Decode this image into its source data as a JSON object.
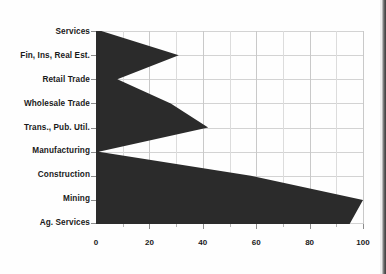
{
  "chart_data": {
    "type": "area",
    "orientation": "horizontal",
    "title": "",
    "subtitle": "",
    "xlabel": "",
    "ylabel": "",
    "xlim": [
      0,
      100
    ],
    "ylim": [
      0,
      8
    ],
    "grid": true,
    "legend": null,
    "legend_position": "none",
    "fill_color": "#2b2b2b",
    "categories": [
      "Services",
      "Fin, Ins, Real Est.",
      "Retail Trade",
      "Wholesale Trade",
      "Trans., Pub. Util.",
      "Manufacturing",
      "Construction",
      "Mining",
      "Ag. Services"
    ],
    "values": [
      2,
      31,
      8,
      28,
      42,
      1,
      58,
      100,
      95
    ],
    "xticks": [
      0,
      20,
      40,
      60,
      80,
      100
    ],
    "xtick_labels": [
      "0",
      "20",
      "40",
      "60",
      "80",
      "100"
    ],
    "xminor_ticks": [
      10,
      30,
      50,
      70,
      90
    ]
  }
}
